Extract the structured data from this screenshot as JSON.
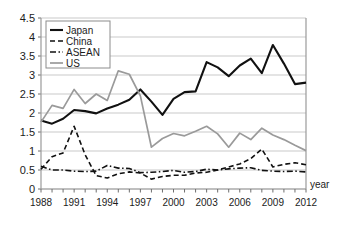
{
  "chart_data": {
    "type": "line",
    "title": "",
    "xlabel": "year",
    "ylabel": "",
    "xlim": [
      1988,
      2012
    ],
    "ylim": [
      0,
      4.5
    ],
    "ystep": 0.5,
    "grid": true,
    "legend_position": "top-left",
    "x": [
      1988,
      1989,
      1990,
      1991,
      1992,
      1993,
      1994,
      1995,
      1996,
      1997,
      1998,
      1999,
      2000,
      2001,
      2002,
      2003,
      2004,
      2005,
      2006,
      2007,
      2008,
      2009,
      2010,
      2011,
      2012
    ],
    "ytick_labels": [
      "0",
      "0.5",
      "1",
      "1.5",
      "2",
      "2.5",
      "3",
      "3.5",
      "4",
      "4.5"
    ],
    "xtick_labels": [
      "1988",
      "1991",
      "1994",
      "1997",
      "2000",
      "2003",
      "2006",
      "2009",
      "2012"
    ],
    "xtick_label_years": [
      1988,
      1991,
      1994,
      1997,
      2000,
      2003,
      2006,
      2009,
      2012
    ],
    "series": [
      {
        "name": "Japan",
        "style": "solid",
        "color": "#111111",
        "width": 2.1,
        "values": [
          1.8,
          1.72,
          1.85,
          2.08,
          2.05,
          1.99,
          2.12,
          2.22,
          2.35,
          2.62,
          2.3,
          1.95,
          2.37,
          2.55,
          2.57,
          3.34,
          3.2,
          2.97,
          3.25,
          3.43,
          3.05,
          3.79,
          3.3,
          2.76,
          2.8
        ]
      },
      {
        "name": "China",
        "style": "dashed",
        "color": "#111111",
        "width": 1.6,
        "values": [
          0.52,
          0.85,
          0.95,
          1.65,
          0.9,
          0.35,
          0.29,
          0.4,
          0.45,
          0.42,
          0.26,
          0.33,
          0.36,
          0.36,
          0.42,
          0.44,
          0.5,
          0.58,
          0.66,
          0.8,
          1.05,
          0.58,
          0.65,
          0.69,
          0.64
        ]
      },
      {
        "name": "ASEAN",
        "style": "dashdot",
        "color": "#111111",
        "width": 1.6,
        "values": [
          0.6,
          0.5,
          0.5,
          0.47,
          0.46,
          0.47,
          0.62,
          0.55,
          0.54,
          0.43,
          0.44,
          0.46,
          0.49,
          0.44,
          0.46,
          0.52,
          0.5,
          0.53,
          0.55,
          0.56,
          0.49,
          0.47,
          0.46,
          0.47,
          0.45
        ]
      },
      {
        "name": "US",
        "style": "solid",
        "color": "#9a9a9a",
        "width": 1.7,
        "values": [
          1.76,
          2.2,
          2.12,
          2.62,
          2.25,
          2.5,
          2.33,
          3.11,
          3.02,
          2.45,
          1.1,
          1.33,
          1.46,
          1.4,
          1.52,
          1.65,
          1.45,
          1.1,
          1.47,
          1.3,
          1.6,
          1.42,
          1.3,
          1.15,
          1.01
        ]
      }
    ]
  },
  "legend": {
    "entries": [
      {
        "label": "Japan"
      },
      {
        "label": "China"
      },
      {
        "label": "ASEAN"
      },
      {
        "label": "US"
      }
    ]
  },
  "axis": {
    "x_caption": "year"
  }
}
